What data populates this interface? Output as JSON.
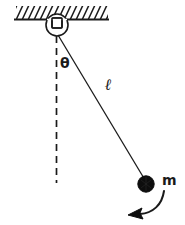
{
  "diagram": {
    "kind": "simple-pendulum-free-body-diagram",
    "background_color": "#ffffff",
    "stroke_color": "#1a1a1a",
    "labels": {
      "angle": "θ",
      "length": "ℓ",
      "mass": "m"
    },
    "parts": {
      "ceiling": "hatched-fixed-support",
      "pivot": "hinge-pivot",
      "vertical_reference": "dashed-vertical-equilibrium-line",
      "rod": "massless-string",
      "bob": "pendulum-bob",
      "motion_arrow": "swing-direction-arrow"
    }
  },
  "geometry": {
    "ceiling_line": {
      "x1": 14,
      "y1": 19.5,
      "x2": 109,
      "y2": 19.5
    },
    "hatch": {
      "x_start": 16,
      "x_end": 108,
      "y_top": 7,
      "y_bottom": 19,
      "slant_dx": 7,
      "spacing": 6
    },
    "pivot": {
      "cx": 57,
      "cy": 25,
      "r": 11
    },
    "pivot_notch": {
      "x": 52,
      "y": 19,
      "w": 10,
      "h": 9
    },
    "dashed_line": {
      "x": 56.5,
      "y1": 36,
      "y2": 183,
      "dash": "6 5"
    },
    "rod": {
      "x1": 58,
      "y1": 36,
      "x2": 145,
      "y2": 180
    },
    "bob": {
      "cx": 146,
      "cy": 184,
      "r": 8
    },
    "arrow": {
      "start_x": 163,
      "start_y": 192,
      "c1x": 160,
      "c1y": 206,
      "c2x": 150,
      "c2y": 213,
      "end_x": 134,
      "end_y": 214
    }
  }
}
